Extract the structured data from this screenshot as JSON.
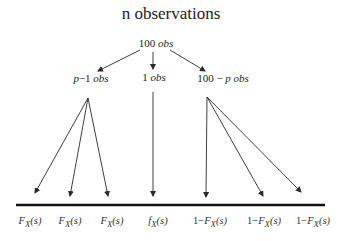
{
  "diagram": {
    "title": "n observations",
    "root": {
      "count": "100",
      "unit": "obs"
    },
    "branches": [
      {
        "id": "left",
        "prefix": "p",
        "sep": "−",
        "count": "1",
        "unit": "obs",
        "x": 91
      },
      {
        "id": "middle",
        "prefix": "",
        "sep": "",
        "count": "1",
        "unit": "obs",
        "x": 154
      },
      {
        "id": "right",
        "prefix": "100",
        "sep": " − ",
        "count": "p",
        "unit": "obs",
        "x": 223
      }
    ],
    "outcomes": [
      {
        "label_prefix": "",
        "func": "F",
        "sub": "X",
        "arg": "(s)",
        "x": 30
      },
      {
        "label_prefix": "",
        "func": "F",
        "sub": "X",
        "arg": "(s)",
        "x": 70
      },
      {
        "label_prefix": "",
        "func": "F",
        "sub": "X",
        "arg": "(s)",
        "x": 112
      },
      {
        "label_prefix": "",
        "func": "f",
        "sub": "X",
        "arg": "(s)",
        "x": 158
      },
      {
        "label_prefix": "1−",
        "func": "F",
        "sub": "X",
        "arg": "(s)",
        "x": 210
      },
      {
        "label_prefix": "1−",
        "func": "F",
        "sub": "X",
        "arg": "(s)",
        "x": 264
      },
      {
        "label_prefix": "1−",
        "func": "F",
        "sub": "X",
        "arg": "(s)",
        "x": 313
      }
    ],
    "colors": {
      "line": "#2a2a2a",
      "baseline": "#111111",
      "text": "#222222"
    }
  }
}
